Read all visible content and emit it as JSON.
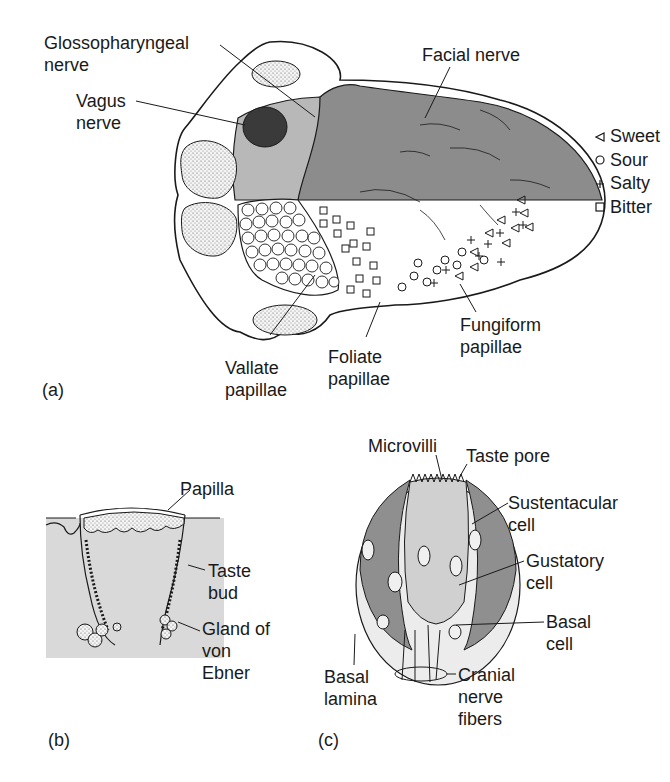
{
  "figure": {
    "panel_a": {
      "tag": "(a)",
      "labels": {
        "glossopharyngeal": "Glossopharyngeal\nnerve",
        "vagus": "Vagus\nnerve",
        "facial": "Facial nerve",
        "vallate": "Vallate\npapillae",
        "foliate": "Foliate\npapillae",
        "fungiform": "Fungiform\npapillae"
      },
      "legend": [
        {
          "symbol": "triangle-left",
          "label": "Sweet"
        },
        {
          "symbol": "circle",
          "label": "Sour"
        },
        {
          "symbol": "plus",
          "label": "Salty"
        },
        {
          "symbol": "square",
          "label": "Bitter"
        }
      ],
      "colors": {
        "facial_region": "#8c8c8c",
        "glossopharyngeal_region": "#b8b8b8",
        "vagus_region": "#3a3a3a",
        "outline": "#1a1a1a"
      }
    },
    "panel_b": {
      "tag": "(b)",
      "labels": {
        "papilla": "Papilla",
        "taste_bud": "Taste\nbud",
        "gland": "Gland of\nvon\nEbner"
      },
      "colors": {
        "tissue": "#d9d9d9"
      }
    },
    "panel_c": {
      "tag": "(c)",
      "labels": {
        "microvilli": "Microvilli",
        "taste_pore": "Taste pore",
        "sustentacular": "Sustentacular\ncell",
        "gustatory": "Gustatory\ncell",
        "basal_cell": "Basal\ncell",
        "basal_lamina": "Basal\nlamina",
        "cranial": "Cranial\nnerve\nfibers"
      },
      "colors": {
        "sustentacular": "#8f8f8f",
        "gustatory": "#d0d0d0"
      }
    }
  }
}
